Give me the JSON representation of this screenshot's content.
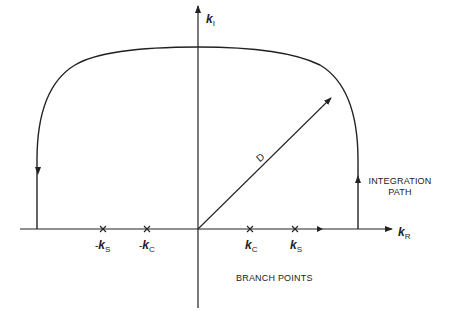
{
  "diagram": {
    "axes": {
      "vertical": {
        "symbol": "k",
        "subscript": "I"
      },
      "horizontal": {
        "symbol": "k",
        "subscript": "R"
      }
    },
    "vector_label": "D",
    "branch_points": [
      {
        "prefix": "-",
        "symbol": "k",
        "subscript": "S"
      },
      {
        "prefix": "-",
        "symbol": "k",
        "subscript": "C"
      },
      {
        "prefix": "",
        "symbol": "k",
        "subscript": "C"
      },
      {
        "prefix": "",
        "symbol": "k",
        "subscript": "S"
      }
    ],
    "labels": {
      "integration_path_line1": "INTEGRATION",
      "integration_path_line2": "PATH",
      "branch_points": "BRANCH POINTS"
    },
    "colors": {
      "stroke": "#222222",
      "background": "#ffffff"
    }
  }
}
